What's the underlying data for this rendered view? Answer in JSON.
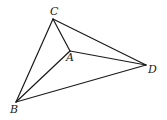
{
  "diagram": {
    "type": "geometry",
    "stroke_color": "#1a1a1a",
    "points": [
      {
        "id": "C",
        "label": "C",
        "x": 53,
        "y": 19,
        "lx": 50,
        "ly": 15
      },
      {
        "id": "A",
        "label": "A",
        "x": 70,
        "y": 51,
        "lx": 66,
        "ly": 61
      },
      {
        "id": "D",
        "label": "D",
        "x": 146,
        "y": 65,
        "lx": 148,
        "ly": 73
      },
      {
        "id": "B",
        "label": "B",
        "x": 16,
        "y": 102,
        "lx": 10,
        "ly": 113
      }
    ],
    "segments": [
      [
        "C",
        "B"
      ],
      [
        "C",
        "D"
      ],
      [
        "C",
        "A"
      ],
      [
        "A",
        "B"
      ],
      [
        "A",
        "D"
      ],
      [
        "B",
        "D"
      ]
    ]
  }
}
